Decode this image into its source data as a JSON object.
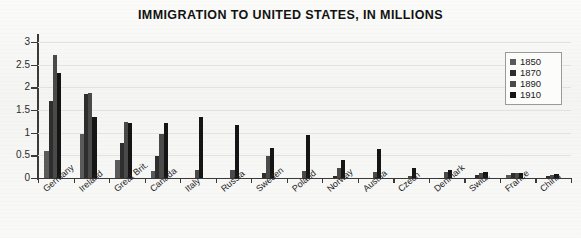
{
  "chart_data": {
    "type": "bar",
    "title": "IMMIGRATION TO UNITED STATES, IN MILLIONS",
    "xlabel": "",
    "ylabel": "",
    "ylim": [
      0,
      3
    ],
    "ytick_labels": [
      "0",
      "0.5",
      "1",
      "1.5",
      "2",
      "2.5",
      "3"
    ],
    "ytick_values": [
      0,
      0.5,
      1,
      1.5,
      2,
      2.5,
      3
    ],
    "grid": true,
    "legend_position": "top-right",
    "categories": [
      "Germany",
      "Ireland",
      "Great Brit.",
      "Canada",
      "Italy",
      "Russia",
      "Sweden",
      "Poland",
      "Norway",
      "Austria",
      "Czech",
      "Denmark",
      "Switz.",
      "France",
      "China"
    ],
    "series": [
      {
        "name": "1850",
        "color": "#5a5a5a",
        "values": [
          0.6,
          0.96,
          0.4,
          0.15,
          0.0,
          0.0,
          0.0,
          0.0,
          0.0,
          0.0,
          0.0,
          0.0,
          0.0,
          0.06,
          0.0
        ]
      },
      {
        "name": "1870",
        "color": "#2e2e2e",
        "values": [
          1.7,
          1.86,
          0.77,
          0.49,
          0.0,
          0.0,
          0.1,
          0.0,
          0.05,
          0.0,
          0.0,
          0.01,
          0.06,
          0.1,
          0.05
        ]
      },
      {
        "name": "1890",
        "color": "#4a4a4a",
        "values": [
          2.72,
          1.87,
          1.23,
          0.98,
          0.18,
          0.18,
          0.48,
          0.15,
          0.22,
          0.13,
          0.05,
          0.13,
          0.1,
          0.11,
          0.07
        ]
      },
      {
        "name": "1910",
        "color": "#151515",
        "values": [
          2.31,
          1.35,
          1.22,
          1.21,
          1.34,
          1.18,
          0.67,
          0.94,
          0.4,
          0.63,
          0.22,
          0.18,
          0.13,
          0.12,
          0.09
        ]
      }
    ]
  },
  "legend": {
    "entries": [
      "1850",
      "1870",
      "1890",
      "1910"
    ]
  }
}
